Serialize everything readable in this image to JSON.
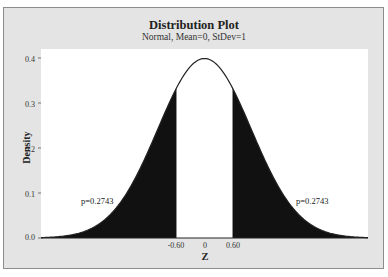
{
  "chart_data": {
    "type": "area",
    "title": "Distribution Plot",
    "subtitle": "Normal, Mean=0, StDev=1",
    "xlabel": "Z",
    "ylabel": "Density",
    "distribution": {
      "name": "Normal",
      "mean": 0,
      "stdev": 1
    },
    "xlim": [
      -3.5,
      3.5
    ],
    "ylim": [
      0,
      0.42
    ],
    "y_ticks": [
      "0.0",
      "0.1",
      "0.2",
      "0.3",
      "0.4"
    ],
    "y_tick_values": [
      0.0,
      0.1,
      0.2,
      0.3,
      0.4
    ],
    "x_ticks": [
      "-0.60",
      "0",
      "0.60"
    ],
    "x_tick_values": [
      -0.6,
      0,
      0.6
    ],
    "shaded_regions": [
      {
        "from": -3.5,
        "to": -0.6,
        "probability": 0.2743,
        "label": "p=0.2743",
        "color": "#111111"
      },
      {
        "from": 0.6,
        "to": 3.5,
        "probability": 0.2743,
        "label": "p=0.2743",
        "color": "#111111"
      }
    ],
    "peak_density": 0.3989,
    "grid": false,
    "legend": null
  },
  "colors": {
    "frame_bg": "#e4e4e4",
    "plot_bg": "#ffffff",
    "shade": "#111111",
    "curve": "#222222"
  }
}
